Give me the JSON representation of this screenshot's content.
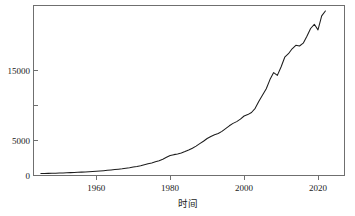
{
  "chart_data": {
    "type": "line",
    "title": "",
    "subtitle": "",
    "xlabel": "时间",
    "ylabel": "",
    "xlim": [
      1945,
      2023
    ],
    "ylim": [
      0,
      23800
    ],
    "grid": false,
    "legend": null,
    "x_ticks": [
      {
        "value": 1960,
        "label": "1960"
      },
      {
        "value": 1980,
        "label": "1980"
      },
      {
        "value": 2000,
        "label": "2000"
      },
      {
        "value": 2020,
        "label": "2020"
      }
    ],
    "y_ticks": [
      {
        "value": 0,
        "label": "0"
      },
      {
        "value": 5000,
        "label": "5000"
      },
      {
        "value": 10000,
        "label": ""
      },
      {
        "value": 15000,
        "label": "15000"
      }
    ],
    "series": [
      {
        "name": "",
        "color": "#1c1c1c",
        "x": [
          1945,
          1946,
          1947,
          1948,
          1949,
          1950,
          1951,
          1952,
          1953,
          1954,
          1955,
          1956,
          1957,
          1958,
          1959,
          1960,
          1961,
          1962,
          1963,
          1964,
          1965,
          1966,
          1967,
          1968,
          1969,
          1970,
          1971,
          1972,
          1973,
          1974,
          1975,
          1976,
          1977,
          1978,
          1979,
          1980,
          1981,
          1982,
          1983,
          1984,
          1985,
          1986,
          1987,
          1988,
          1989,
          1990,
          1991,
          1992,
          1993,
          1994,
          1995,
          1996,
          1997,
          1998,
          1999,
          2000,
          2001,
          2002,
          2003,
          2004,
          2005,
          2006,
          2007,
          2008,
          2009,
          2010,
          2011,
          2012,
          2013,
          2014,
          2015,
          2016,
          2017,
          2018,
          2019,
          2020,
          2021,
          2022
        ],
        "values": [
          280,
          290,
          305,
          320,
          335,
          350,
          370,
          390,
          410,
          430,
          455,
          480,
          510,
          540,
          575,
          610,
          645,
          690,
          735,
          790,
          845,
          905,
          965,
          1035,
          1110,
          1200,
          1290,
          1400,
          1540,
          1680,
          1800,
          1960,
          2120,
          2330,
          2600,
          2860,
          2980,
          3080,
          3210,
          3420,
          3650,
          3900,
          4200,
          4560,
          4900,
          5280,
          5580,
          5820,
          6000,
          6300,
          6700,
          7100,
          7450,
          7700,
          8050,
          8500,
          8700,
          9000,
          9600,
          10600,
          11500,
          12400,
          13700,
          14700,
          14300,
          15500,
          16900,
          17400,
          18100,
          18600,
          18500,
          18900,
          19900,
          21000,
          21600,
          20800,
          22800,
          23500
        ]
      }
    ],
    "annotations": [
      {
        "year": 2001,
        "note": "plateau"
      },
      {
        "year": 2009,
        "note": "dip"
      },
      {
        "year": 2020,
        "note": "sharp dip"
      }
    ]
  },
  "axis": {
    "x_title": "时间"
  }
}
